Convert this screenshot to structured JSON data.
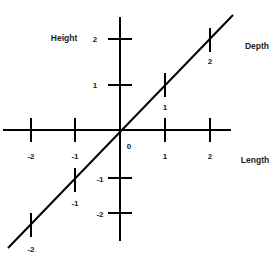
{
  "diagram": {
    "title": "",
    "axes": [
      {
        "name": "Length",
        "ticks": [
          "-2",
          "-1",
          "1",
          "2"
        ]
      },
      {
        "name": "Height",
        "ticks": [
          "2",
          "1",
          "-1",
          "-2"
        ]
      },
      {
        "name": "Depth",
        "ticks": [
          "2",
          "1",
          "-1",
          "-2"
        ]
      }
    ],
    "origin_label": "0",
    "line_color": "#000000"
  },
  "labels": {
    "length": "Length",
    "height": "Height",
    "depth": "Depth",
    "origin": "0",
    "length_ticks": {
      "n2": "-2",
      "n1": "-1",
      "p1": "1",
      "p2": "2"
    },
    "height_ticks": {
      "p2": "2",
      "p1": "1",
      "n1": "-1",
      "n2": "-2"
    },
    "depth_ticks": {
      "p2": "2",
      "p1": "1",
      "n1": "-1",
      "n2": "-2"
    }
  }
}
